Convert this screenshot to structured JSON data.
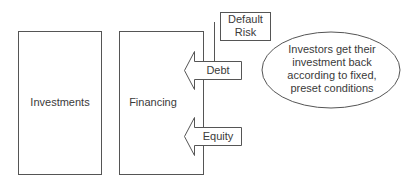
{
  "diagram": {
    "boxes": {
      "investments": "Investments",
      "financing": "Financing"
    },
    "arrows": {
      "debt": "Debt",
      "equity": "Equity"
    },
    "callout_box": {
      "line1": "Default",
      "line2": "Risk"
    },
    "ellipse": {
      "line1": "Investors get their",
      "line2": "investment back",
      "line3": "according to fixed,",
      "line4": "preset conditions"
    },
    "colors": {
      "stroke": "#555555",
      "fill": "#ffffff",
      "text": "#3a3a3a"
    }
  }
}
